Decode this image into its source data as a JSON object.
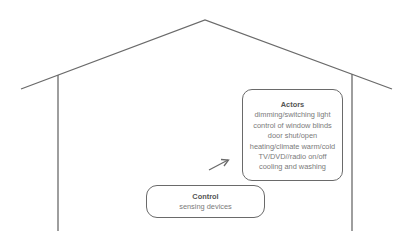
{
  "diagram": {
    "actors": {
      "title": "Actors",
      "items": [
        "dimming/switching light",
        "control of window blinds",
        "door shut/open",
        "heating/climate warm/cold",
        "TV/DVD//radio on/off",
        "cooling and washing"
      ]
    },
    "control": {
      "title": "Control",
      "subtitle": "sensing devices"
    },
    "colors": {
      "line": "#6a6a6a",
      "text": "#7a7a7a"
    }
  }
}
